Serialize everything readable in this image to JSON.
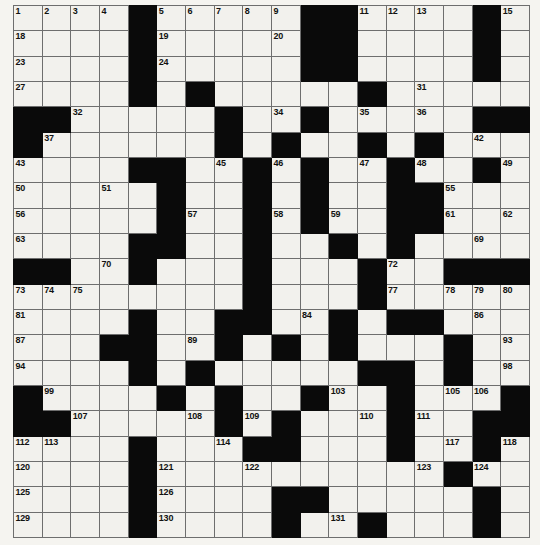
{
  "puzzle": {
    "title": "Crossword Grid",
    "type": "crossword",
    "rows": 18,
    "columns": 18,
    "cell_size_px": 28.6,
    "colors": {
      "block": "#0a0a0a",
      "cell": "#f2f1ed",
      "grid_line": "#6e6e6e",
      "number_text": "#111111",
      "page_background": "#f5f4f0"
    },
    "clue_number_range": {
      "first": 1,
      "last": 132
    },
    "grid": [
      {
        "row": 0,
        "blocks": [
          4,
          9,
          10,
          13
        ],
        "numbers": {
          "0": "1",
          "1": "2",
          "2": "3",
          "3": "4",
          "5": "5",
          "6": "6",
          "7": "7",
          "8": "8",
          "11": "9",
          "12": "10",
          "14": "11",
          "15": "12",
          "16": "13",
          "17": "14"
        }
      },
      {
        "row": 1,
        "blocks": [],
        "numbers": {}
      },
      {
        "row": 2,
        "blocks": [],
        "numbers": {}
      },
      {
        "row": 3,
        "blocks": [],
        "numbers": {}
      }
    ],
    "layout": {
      "blocks": [
        [
          4,
          10,
          15
        ],
        [
          4,
          10,
          15
        ],
        [
          4,
          10,
          15
        ],
        [
          5,
          9,
          15
        ],
        [
          0,
          1,
          10,
          16,
          17
        ],
        [
          0,
          9,
          13,
          17
        ],
        [
          4,
          5,
          8,
          9,
          13
        ],
        [
          3,
          4,
          5,
          12,
          13,
          14
        ],
        [
          5,
          6,
          9,
          13,
          14
        ],
        [
          5,
          6,
          11,
          14
        ],
        [
          6,
          7,
          8,
          12,
          13
        ],
        [
          0,
          1,
          6,
          7,
          12,
          16,
          17
        ],
        [
          6,
          7,
          12
        ],
        [
          4,
          8,
          9,
          13,
          14
        ],
        [
          4,
          5,
          7,
          12,
          13
        ],
        [
          5,
          8,
          13,
          16,
          17
        ],
        [
          0,
          5,
          8,
          11,
          17
        ],
        [
          0,
          1,
          5,
          8,
          9,
          13,
          17
        ]
      ],
      "numbers": [
        {
          "r": 0,
          "c": 0,
          "n": "1"
        },
        {
          "r": 0,
          "c": 1,
          "n": "2"
        },
        {
          "r": 0,
          "c": 2,
          "n": "3"
        },
        {
          "r": 0,
          "c": 3,
          "n": "4"
        },
        {
          "r": 0,
          "c": 5,
          "n": "5"
        },
        {
          "r": 0,
          "c": 6,
          "n": "6"
        },
        {
          "r": 0,
          "c": 7,
          "n": "7"
        },
        {
          "r": 0,
          "c": 8,
          "n": "8"
        },
        {
          "r": 0,
          "c": 9,
          "n": "9"
        },
        {
          "r": 0,
          "c": 11,
          "n": "10"
        },
        {
          "r": 0,
          "c": 12,
          "n": "11"
        },
        {
          "r": 0,
          "c": 13,
          "n": "12"
        },
        {
          "r": 0,
          "c": 14,
          "n": "13"
        },
        {
          "r": 0,
          "c": 16,
          "n": "14"
        },
        {
          "r": 0,
          "c": 17,
          "n": "15"
        },
        {
          "r": 1,
          "c": 0,
          "n": "18"
        },
        {
          "r": 1,
          "c": 5,
          "n": "19"
        },
        {
          "r": 1,
          "c": 9,
          "n": "20"
        },
        {
          "r": 1,
          "c": 11,
          "n": "21"
        },
        {
          "r": 1,
          "c": 16,
          "n": "22"
        },
        {
          "r": 2,
          "c": 0,
          "n": "23"
        },
        {
          "r": 2,
          "c": 5,
          "n": "24"
        },
        {
          "r": 2,
          "c": 10,
          "n": "25"
        },
        {
          "r": 2,
          "c": 16,
          "n": "26"
        },
        {
          "r": 3,
          "c": 0,
          "n": "27"
        },
        {
          "r": 3,
          "c": 4,
          "n": "28"
        },
        {
          "r": 3,
          "c": 6,
          "n": "29"
        },
        {
          "r": 3,
          "c": 11,
          "n": "30"
        },
        {
          "r": 3,
          "c": 14,
          "n": "31"
        },
        {
          "r": 4,
          "c": 2,
          "n": "32"
        },
        {
          "r": 4,
          "c": 6,
          "n": "33"
        },
        {
          "r": 4,
          "c": 8,
          "n": "34"
        },
        {
          "r": 4,
          "c": 12,
          "n": "35"
        },
        {
          "r": 4,
          "c": 14,
          "n": "36"
        },
        {
          "r": 5,
          "c": 1,
          "n": "37"
        },
        {
          "r": 5,
          "c": 7,
          "n": "38"
        },
        {
          "r": 5,
          "c": 9,
          "n": "39"
        },
        {
          "r": 5,
          "c": 13,
          "n": "40"
        },
        {
          "r": 5,
          "c": 15,
          "n": "41"
        },
        {
          "r": 5,
          "c": 18,
          "n": "42"
        },
        {
          "r": 6,
          "c": 0,
          "n": "43"
        },
        {
          "r": 6,
          "c": 4,
          "n": "44"
        },
        {
          "r": 6,
          "c": 7,
          "n": "45"
        },
        {
          "r": 6,
          "c": 10,
          "n": "46"
        },
        {
          "r": 6,
          "c": 13,
          "n": "47"
        },
        {
          "r": 6,
          "c": 15,
          "n": "48"
        },
        {
          "r": 6,
          "c": 18,
          "n": "49"
        },
        {
          "r": 7,
          "c": 0,
          "n": "50"
        },
        {
          "r": 7,
          "c": 3,
          "n": "51"
        },
        {
          "r": 7,
          "c": 5,
          "n": "52"
        },
        {
          "r": 7,
          "c": 8,
          "n": "53"
        },
        {
          "r": 7,
          "c": 10,
          "n": "54"
        },
        {
          "r": 7,
          "c": 15,
          "n": "55"
        },
        {
          "r": 8,
          "c": 0,
          "n": "56"
        },
        {
          "r": 8,
          "c": 6,
          "n": "57"
        },
        {
          "r": 8,
          "c": 9,
          "n": "58"
        },
        {
          "r": 8,
          "c": 11,
          "n": "59"
        },
        {
          "r": 8,
          "c": 14,
          "n": "60"
        },
        {
          "r": 8,
          "c": 15,
          "n": "61"
        },
        {
          "r": 8,
          "c": 17,
          "n": "62"
        },
        {
          "r": 9,
          "c": 0,
          "n": "63"
        },
        {
          "r": 9,
          "c": 4,
          "n": "64"
        },
        {
          "r": 9,
          "c": 5,
          "n": "65"
        },
        {
          "r": 9,
          "c": 8,
          "n": "66"
        },
        {
          "r": 9,
          "c": 11,
          "n": "67"
        },
        {
          "r": 9,
          "c": 13,
          "n": "68"
        },
        {
          "r": 9,
          "c": 16,
          "n": "69"
        },
        {
          "r": 10,
          "c": 3,
          "n": "70"
        },
        {
          "r": 10,
          "c": 8,
          "n": "71"
        },
        {
          "r": 10,
          "c": 13,
          "n": "72"
        },
        {
          "r": 11,
          "c": 0,
          "n": "73"
        },
        {
          "r": 11,
          "c": 1,
          "n": "74"
        },
        {
          "r": 11,
          "c": 2,
          "n": "75"
        },
        {
          "r": 11,
          "c": 8,
          "n": "76"
        },
        {
          "r": 11,
          "c": 13,
          "n": "77"
        },
        {
          "r": 11,
          "c": 16,
          "n": "78"
        },
        {
          "r": 11,
          "c": 17,
          "n": "79"
        },
        {
          "r": 11,
          "c": 18,
          "n": "80"
        },
        {
          "r": 12,
          "c": 0,
          "n": "81"
        },
        {
          "r": 12,
          "c": 4,
          "n": "82"
        },
        {
          "r": 12,
          "c": 7,
          "n": "83"
        },
        {
          "r": 12,
          "c": 10,
          "n": "84"
        },
        {
          "r": 12,
          "c": 13,
          "n": "85"
        },
        {
          "r": 12,
          "c": 16,
          "n": "86"
        },
        {
          "r": 13,
          "c": 0,
          "n": "87"
        },
        {
          "r": 13,
          "c": 3,
          "n": "88"
        },
        {
          "r": 13,
          "c": 6,
          "n": "89"
        },
        {
          "r": 13,
          "c": 9,
          "n": "90"
        },
        {
          "r": 13,
          "c": 11,
          "n": "91"
        },
        {
          "r": 13,
          "c": 15,
          "n": "92"
        },
        {
          "r": 13,
          "c": 17,
          "n": "93"
        },
        {
          "r": 14,
          "c": 0,
          "n": "94"
        },
        {
          "r": 14,
          "c": 4,
          "n": "95"
        },
        {
          "r": 14,
          "c": 6,
          "n": "96"
        },
        {
          "r": 14,
          "c": 12,
          "n": "97"
        },
        {
          "r": 14,
          "c": 17,
          "n": "98"
        },
        {
          "r": 15,
          "c": 1,
          "n": "99"
        },
        {
          "r": 15,
          "c": 5,
          "n": "100"
        },
        {
          "r": 15,
          "c": 7,
          "n": "101"
        },
        {
          "r": 15,
          "c": 10,
          "n": "102"
        },
        {
          "r": 15,
          "c": 11,
          "n": "103"
        },
        {
          "r": 15,
          "c": 13,
          "n": "104"
        },
        {
          "r": 15,
          "c": 16,
          "n": "105"
        },
        {
          "r": 15,
          "c": 17,
          "n": "106"
        },
        {
          "r": 16,
          "c": 2,
          "n": "107"
        },
        {
          "r": 16,
          "c": 6,
          "n": "108"
        },
        {
          "r": 16,
          "c": 8,
          "n": "109"
        },
        {
          "r": 16,
          "c": 12,
          "n": "110"
        },
        {
          "r": 16,
          "c": 14,
          "n": "111"
        },
        {
          "r": 17,
          "c": 0,
          "n": "112"
        },
        {
          "r": 17,
          "c": 1,
          "n": "113"
        },
        {
          "r": 17,
          "c": 7,
          "n": "114"
        },
        {
          "r": 17,
          "c": 9,
          "n": "115"
        },
        {
          "r": 17,
          "c": 13,
          "n": "116"
        },
        {
          "r": 17,
          "c": 15,
          "n": "117"
        },
        {
          "r": 17,
          "c": 18,
          "n": "118"
        },
        {
          "r": 17,
          "c": 19,
          "n": "119"
        },
        {
          "r": 18,
          "c": 0,
          "n": "120"
        },
        {
          "r": 18,
          "c": 5,
          "n": "121"
        },
        {
          "r": 18,
          "c": 8,
          "n": "122"
        },
        {
          "r": 18,
          "c": 14,
          "n": "123"
        },
        {
          "r": 18,
          "c": 16,
          "n": "124"
        },
        {
          "r": 19,
          "c": 0,
          "n": "125"
        },
        {
          "r": 19,
          "c": 5,
          "n": "126"
        },
        {
          "r": 19,
          "c": 10,
          "n": "127"
        },
        {
          "r": 19,
          "c": 16,
          "n": "128"
        },
        {
          "r": 20,
          "c": 0,
          "n": "129"
        },
        {
          "r": 20,
          "c": 5,
          "n": "130"
        },
        {
          "r": 20,
          "c": 11,
          "n": "131"
        },
        {
          "r": 20,
          "c": 16,
          "n": "132"
        }
      ]
    },
    "cells": [
      [
        {
          "t": "n",
          "n": "1"
        },
        {
          "t": "n",
          "n": "2"
        },
        {
          "t": "n",
          "n": "3"
        },
        {
          "t": "n",
          "n": "4"
        },
        {
          "t": "b"
        },
        {
          "t": "n",
          "n": "5"
        },
        {
          "t": "n",
          "n": "6"
        },
        {
          "t": "n",
          "n": "7"
        },
        {
          "t": "n",
          "n": "8"
        },
        {
          "t": "n",
          "n": "9"
        },
        {
          "t": "b"
        },
        {
          "t": "b"
        },
        {
          "t": "n",
          "n": "10"
        },
        {
          "t": "n",
          "n": "11"
        },
        {
          "t": "n",
          "n": "12"
        },
        {
          "t": "n",
          "n": "13"
        },
        {
          "t": "b"
        },
        {
          "t": "n",
          "n": "14"
        },
        {
          "t": "n",
          "n": "15"
        },
        {
          "t": "n",
          "n": "16"
        },
        {
          "t": "n",
          "n": "17"
        }
      ]
    ],
    "grid_matrix": [
      "....#.....##....#....",
      "....#.....##....#....",
      "....#.....##....#....",
      "....#.....##....#...."
    ],
    "rows_spec": [
      {
        "blocks": [
          4,
          10,
          11,
          16
        ],
        "nums": [
          [
            "0",
            "1"
          ],
          [
            "1",
            "2"
          ],
          [
            "2",
            "3"
          ],
          [
            "3",
            "4"
          ],
          [
            "5",
            "5"
          ],
          [
            "6",
            "6"
          ],
          [
            "7",
            "7"
          ],
          [
            "8",
            "8"
          ],
          [
            "9",
            "9"
          ],
          [
            "12",
            "10"
          ],
          [
            "13",
            "11"
          ],
          [
            "14",
            "12"
          ],
          [
            "15",
            "13"
          ],
          [
            "17",
            "14"
          ],
          [
            "18",
            "15"
          ],
          [
            "19",
            "16"
          ],
          [
            "20",
            "17"
          ]
        ]
      }
    ]
  }
}
